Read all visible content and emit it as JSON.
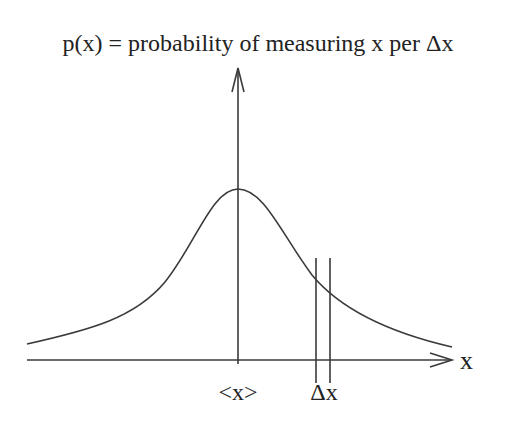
{
  "title": "p(x) = probability of measuring x per Δx",
  "axes": {
    "x_label": "x",
    "mean_label": "<x>",
    "interval_label": "Δx"
  },
  "colors": {
    "line": "#3a3a3a",
    "text": "#222222",
    "background": "#ffffff"
  }
}
